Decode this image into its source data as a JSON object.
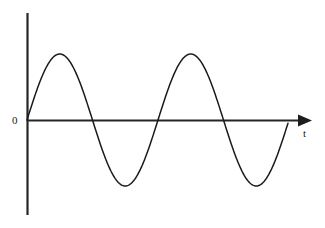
{
  "figure": {
    "background_color": "#ffffff",
    "width": 325,
    "height": 228
  },
  "labels": {
    "origin": "0",
    "x_axis": "t"
  },
  "colors": {
    "axis": "#262626",
    "curve": "#1a1a1a",
    "arrow": "#1d1d1d",
    "background": "#ffffff"
  },
  "icons": {
    "x_axis_arrow": "arrow-right-icon"
  },
  "chart_data": {
    "type": "line",
    "title": "",
    "xlabel": "t",
    "ylabel": "",
    "grid": false,
    "legend": null,
    "axes": {
      "x_axis": {
        "label": "t",
        "origin_label": "0",
        "pixel_y": 120,
        "pixel_x_start": 27,
        "pixel_x_end": 297,
        "has_arrow": true,
        "arrow_tip_x": 311,
        "ticks": []
      },
      "y_axis": {
        "label": "",
        "pixel_x": 27,
        "pixel_y_top": 13,
        "pixel_y_bottom": 215,
        "has_arrow": false,
        "ticks": []
      }
    },
    "waveform": {
      "function": "sine",
      "amplitude_px": 66,
      "period_px": 131,
      "cycles": 2,
      "phase": 0,
      "start_x_px": 27,
      "end_x_px": 288,
      "baseline_y_px": 120
    },
    "key_points": [
      {
        "name": "origin",
        "x_px": 27,
        "y_px": 120,
        "value": 0
      },
      {
        "name": "crest-1",
        "x_px": 57,
        "y_px": 54,
        "value": 1
      },
      {
        "name": "zero-crossing-1",
        "x_px": 90,
        "y_px": 120,
        "value": 0
      },
      {
        "name": "trough-1",
        "x_px": 122,
        "y_px": 188,
        "value": -1
      },
      {
        "name": "zero-crossing-2",
        "x_px": 157,
        "y_px": 120,
        "value": 0
      },
      {
        "name": "crest-2",
        "x_px": 190,
        "y_px": 53,
        "value": 1
      },
      {
        "name": "zero-crossing-3",
        "x_px": 222,
        "y_px": 120,
        "value": 0
      },
      {
        "name": "trough-2",
        "x_px": 253,
        "y_px": 187,
        "value": -1
      },
      {
        "name": "end",
        "x_px": 288,
        "y_px": 120,
        "value": 0
      }
    ],
    "x": [
      0,
      0.25,
      0.5,
      0.75,
      1,
      1.25,
      1.5,
      1.75,
      2
    ],
    "values": [
      0,
      1,
      0,
      -1,
      0,
      1,
      0,
      -1,
      0
    ],
    "xlim": [
      0,
      2.1
    ],
    "ylim": [
      -1.2,
      1.2
    ]
  },
  "wave_path": "M 27,120 C 33.2,120 40.1,93.6 44.2,80.0 C 48.4,66.4 52.0,54.3 57.2,54.0 C 62.4,53.8 66.5,64.8 70.8,78.8 C 75.1,92.8 81.5,120 90.0,120 C 98.5,120 104.9,148.5 109.4,163.4 C 113.9,178.3 117.6,188.2 122.4,188.0 C 127.2,187.8 131.5,177.4 136.0,162.3 C 140.5,147.2 147.6,120 157.0,120 C 166.4,120 171.8,93.0 176.0,79.0 C 180.2,65.0 184.5,53.2 190.0,53.0 C 195.5,52.8 199.7,64.0 204.0,78.3 C 208.3,92.6 214.4,120 222.0,120 C 229.6,120 235.0,147.0 239.5,162.2 C 244.0,177.4 248.2,187.2 253.0,187.0 C 257.8,186.8 262.4,176.5 267.2,161.2 C 272.0,145.9 279.5,120 288.0,120"
}
